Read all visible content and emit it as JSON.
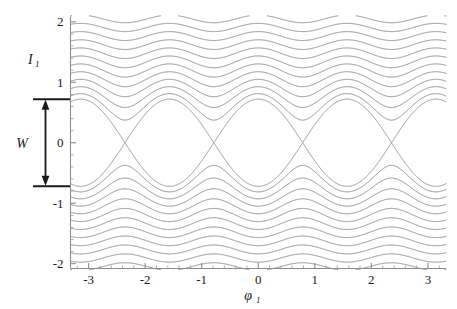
{
  "chart_data": {
    "type": "line",
    "title": "",
    "subtitle": "",
    "xlabel": "φ",
    "xlabel_sub": "1",
    "ylabel": "I",
    "ylabel_sub": "1",
    "xlim": [
      -3.32,
      3.32
    ],
    "ylim": [
      -2.08,
      2.08
    ],
    "grid": false,
    "legend": "none",
    "xticks": [
      -3,
      -2,
      -1,
      0,
      1,
      2,
      3
    ],
    "xticklabels": [
      "-3",
      "-2",
      "-1",
      "0",
      "1",
      "2",
      "3"
    ],
    "yticks": [
      -2,
      -1,
      0,
      1,
      2
    ],
    "yticklabels": [
      "-2",
      "-1",
      "0",
      "1",
      "2"
    ],
    "x_minor_step": 0.2,
    "y_minor_step": 0.2,
    "line_color": "#808080",
    "axis_color": "#8d8d8d",
    "annotation_color": "#1a1a1a",
    "background_color": "#ffffff",
    "hamiltonian": {
      "form": "H = 0.5*I^2 - k*cos(4*phi)",
      "k": 0.13,
      "resonance_order": 4
    },
    "separatrix": {
      "half_width_W": 0.721,
      "value": 0.13,
      "x_points": [
        -3.1416,
        -1.5708,
        0.0,
        1.5708,
        3.1416
      ],
      "o_points": [
        -2.3562,
        -0.7854,
        0.7854,
        2.3562
      ]
    },
    "islands": [
      {
        "center_phi": -2.3562,
        "center_I": 0.0
      },
      {
        "center_phi": -0.7854,
        "center_I": 0.0
      },
      {
        "center_phi": 0.7854,
        "center_I": 0.0
      },
      {
        "center_phi": 2.3562,
        "center_I": 0.0
      }
    ],
    "contour_levels_inner": [
      -0.1,
      -0.04,
      0.02,
      0.085
    ],
    "contour_levels_outer": [
      0.2,
      0.3,
      0.42,
      0.56,
      0.72,
      0.9,
      1.1,
      1.32,
      1.56,
      1.82,
      2.1,
      2.4,
      2.72,
      3.06,
      3.42,
      3.8,
      4.2,
      4.62,
      5.06,
      5.52,
      6.0
    ],
    "series": [
      {
        "name": "separatrix",
        "level": 0.13
      },
      {
        "name": "trapped-orbits",
        "count": 4
      },
      {
        "name": "circulating-orbits-upper",
        "count": 21
      },
      {
        "name": "circulating-orbits-lower",
        "count": 21
      }
    ]
  },
  "annotation": {
    "width_label": "W",
    "width_value": 1.442,
    "top_bar_I": 0.721,
    "bottom_bar_I": -0.721
  },
  "axes": {
    "x_title": "φ",
    "x_title_sub": "1",
    "y_title": "I",
    "y_title_sub": "1"
  }
}
